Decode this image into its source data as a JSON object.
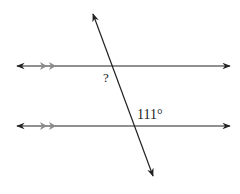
{
  "diagram": {
    "type": "parallel-lines-transversal",
    "colors": {
      "line": "#222222",
      "tick": "#8a8a8a",
      "background": "#ffffff"
    },
    "labels": {
      "unknown_angle": "?",
      "known_angle": "111°"
    },
    "lines": [
      {
        "name": "top-parallel-line",
        "x1": 17,
        "y1": 66,
        "x2": 230,
        "y2": 66
      },
      {
        "name": "bottom-parallel-line",
        "x1": 17,
        "y1": 126,
        "x2": 230,
        "y2": 126
      },
      {
        "name": "transversal",
        "x1": 93,
        "y1": 14,
        "x2": 153,
        "y2": 176
      }
    ],
    "parallel_marks": "double-arrow"
  }
}
